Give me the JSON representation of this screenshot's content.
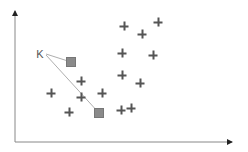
{
  "diagram": {
    "type": "knn-scatter",
    "query_label": "K",
    "colors": {
      "axis": "#888888",
      "point": "#555555",
      "neighbor": "#8a8a8a",
      "link": "#999999"
    },
    "axes": {
      "origin": [
        15,
        142
      ],
      "x_end": [
        233,
        142
      ],
      "y_end": [
        15,
        10
      ]
    },
    "query_point": [
      43,
      54
    ],
    "neighbors": [
      [
        71,
        62
      ],
      [
        99,
        113
      ]
    ],
    "points": [
      [
        81,
        81
      ],
      [
        51,
        93
      ],
      [
        81,
        97
      ],
      [
        102,
        93
      ],
      [
        69,
        112
      ],
      [
        124,
        26
      ],
      [
        142,
        34
      ],
      [
        158,
        22
      ],
      [
        122,
        53
      ],
      [
        153,
        55
      ],
      [
        122,
        75
      ],
      [
        140,
        83
      ],
      [
        121,
        110
      ],
      [
        131,
        108
      ]
    ]
  }
}
